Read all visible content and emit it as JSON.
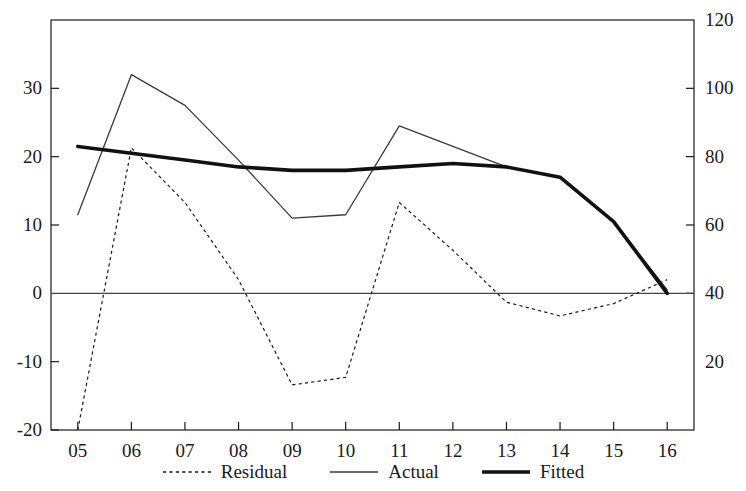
{
  "chart_data": {
    "type": "line",
    "title": "",
    "subtitle": "",
    "xlabel": "",
    "ylabel": "",
    "x": [
      "05",
      "06",
      "07",
      "08",
      "09",
      "10",
      "11",
      "12",
      "13",
      "14",
      "15",
      "16"
    ],
    "categories": [
      "05",
      "06",
      "07",
      "08",
      "09",
      "10",
      "11",
      "12",
      "13",
      "14",
      "15",
      "16"
    ],
    "grid": false,
    "legend_position": "bottom",
    "axes": {
      "left": {
        "label": "",
        "ticks": [
          "-20",
          "-10",
          "0",
          "10",
          "20",
          "30"
        ],
        "tick_values": [
          -20,
          -10,
          0,
          10,
          20,
          30
        ],
        "range": [
          -20,
          40
        ],
        "assigned_series": [
          "Residual"
        ]
      },
      "right": {
        "label": "",
        "ticks": [
          "20",
          "40",
          "60",
          "80",
          "100",
          "120"
        ],
        "tick_values": [
          20,
          40,
          60,
          80,
          100,
          120
        ],
        "range": [
          0,
          120
        ],
        "assigned_series": [
          "Actual",
          "Fitted"
        ]
      },
      "bottom": {
        "label": "",
        "ticks": [
          "05",
          "06",
          "07",
          "08",
          "09",
          "10",
          "11",
          "12",
          "13",
          "14",
          "15",
          "16"
        ]
      }
    },
    "zero_line": {
      "value": 0,
      "axis": "left",
      "visible": true
    },
    "series": [
      {
        "name": "Residual",
        "axis": "left",
        "style": "dotted",
        "width": 1.2,
        "color": "#1a1a1a",
        "values": [
          -20.0,
          21.3,
          13.3,
          2.0,
          -13.4,
          -12.3,
          13.3,
          6.3,
          -1.3,
          -3.3,
          -1.5,
          2.0
        ]
      },
      {
        "name": "Actual",
        "axis": "right",
        "style": "solid-thin",
        "width": 1.3,
        "color": "#3a3a3a",
        "values": [
          63,
          104,
          95,
          79,
          62,
          63,
          89,
          83,
          77,
          74,
          61,
          41
        ]
      },
      {
        "name": "Fitted",
        "axis": "right",
        "style": "solid-thick",
        "width": 3.6,
        "color": "#111111",
        "values": [
          83,
          81,
          79,
          77,
          76,
          76,
          77,
          78,
          77,
          74,
          61,
          40
        ]
      }
    ]
  },
  "legend": {
    "items": [
      {
        "label": "Residual",
        "style": "dotted"
      },
      {
        "label": "Actual",
        "style": "solid-thin"
      },
      {
        "label": "Fitted",
        "style": "solid-thick"
      }
    ]
  },
  "colors": {
    "axis": "#1a1a1a",
    "residual": "#1a1a1a",
    "actual": "#3a3a3a",
    "fitted": "#111111",
    "background": "#ffffff"
  }
}
